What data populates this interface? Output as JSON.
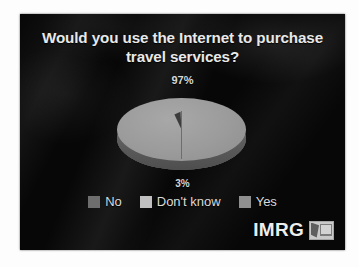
{
  "slide": {
    "title": "Would you use the Internet to purchase travel services?",
    "background_color": "#070707",
    "text_color": "#e9e9e9"
  },
  "chart_data": {
    "type": "pie",
    "title": "Would you use the Internet to purchase travel services?",
    "categories": [
      "Yes",
      "No",
      "Don't know"
    ],
    "values": [
      97,
      3,
      0
    ],
    "value_labels": [
      "97%",
      "3%",
      ""
    ],
    "labels_shown": [
      "97%",
      "3%"
    ],
    "legend": [
      {
        "label": "No",
        "color": "#6e6e6e"
      },
      {
        "label": "Don't know",
        "color": "#c0c0c0"
      },
      {
        "label": "Yes",
        "color": "#8f8f8f"
      }
    ],
    "legend_position": "bottom",
    "grid": false,
    "xlabel": "",
    "ylabel": "",
    "three_d": true,
    "units": "percent"
  },
  "labels": {
    "top_percent": "97%",
    "bottom_percent": "3%"
  },
  "brand": {
    "name": "IMRG",
    "mark_icon": "imrg-logo-icon"
  }
}
